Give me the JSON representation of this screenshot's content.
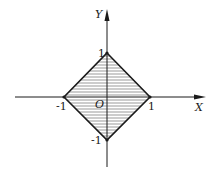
{
  "diagram": {
    "type": "coordinate-region",
    "axes": {
      "x_label": "X",
      "y_label": "Y",
      "origin_label": "O"
    },
    "ticks": {
      "x_pos": "1",
      "x_neg": "-1",
      "y_pos": "1",
      "y_neg": "-1"
    },
    "vertices": [
      {
        "x": 0,
        "y": 1
      },
      {
        "x": 1,
        "y": 0
      },
      {
        "x": 0,
        "y": -1
      },
      {
        "x": -1,
        "y": 0
      }
    ],
    "fill": "horizontal-hatch",
    "colors": {
      "stroke": "#1a1a1a",
      "hatch": "#555555",
      "background": "#ffffff"
    }
  }
}
